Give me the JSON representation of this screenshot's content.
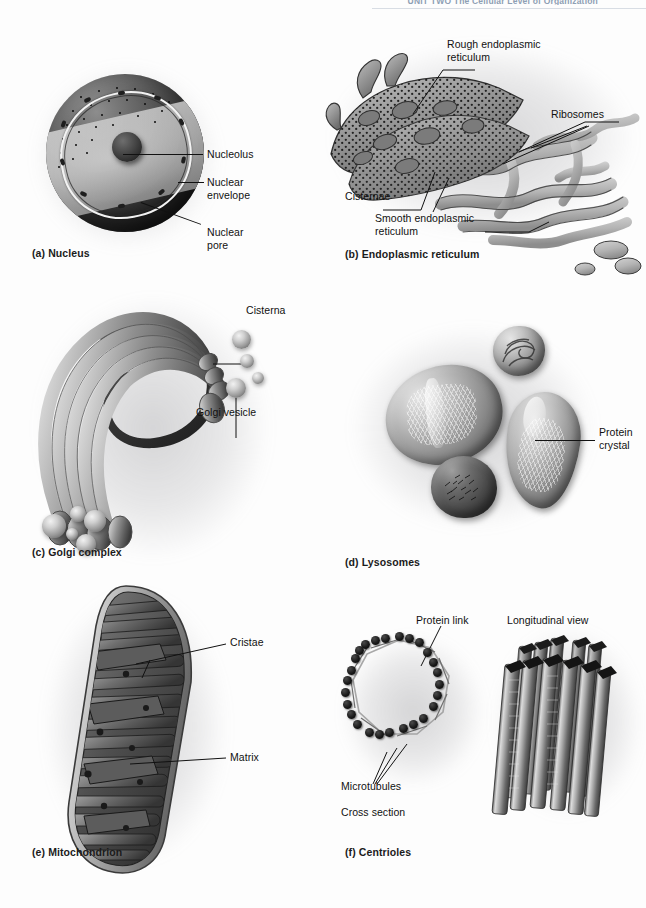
{
  "running_head": {
    "text": "UNIT TWO  The Cellular Level of Organization",
    "visible": true
  },
  "figure": {
    "panels": [
      {
        "id": "a",
        "caption": "(a) Nucleus",
        "labels": [
          {
            "name": "nucleolus",
            "text": "Nucleolus"
          },
          {
            "name": "nuclear-envelope",
            "text": "Nuclear\nenvelope"
          },
          {
            "name": "nuclear-pore",
            "text": "Nuclear\npore"
          }
        ]
      },
      {
        "id": "b",
        "caption": "(b) Endoplasmic reticulum",
        "labels": [
          {
            "name": "rough-er",
            "text": "Rough endoplasmic\nreticulum"
          },
          {
            "name": "ribosomes",
            "text": "Ribosomes"
          },
          {
            "name": "cisternae",
            "text": "Cisternae"
          },
          {
            "name": "smooth-er",
            "text": "Smooth endoplasmic\nreticulum"
          }
        ]
      },
      {
        "id": "c",
        "caption": "(c) Golgi complex",
        "labels": [
          {
            "name": "cisterna",
            "text": "Cisterna"
          },
          {
            "name": "golgi-vesicle",
            "text": "Golgi vesicle"
          }
        ]
      },
      {
        "id": "d",
        "caption": "(d) Lysosomes",
        "labels": [
          {
            "name": "protein-crystal",
            "text": "Protein\ncrystal"
          }
        ]
      },
      {
        "id": "e",
        "caption": "(e) Mitochondrion",
        "labels": [
          {
            "name": "cristae",
            "text": "Cristae"
          },
          {
            "name": "matrix",
            "text": "Matrix"
          }
        ]
      },
      {
        "id": "f",
        "caption": "(f) Centrioles",
        "labels": [
          {
            "name": "protein-link",
            "text": "Protein link"
          },
          {
            "name": "longitudinal-view",
            "text": "Longitudinal view"
          },
          {
            "name": "microtubules",
            "text": "Microtubules"
          },
          {
            "name": "cross-section",
            "text": "Cross section"
          }
        ]
      }
    ]
  },
  "colors": {
    "page_background": "#fdfdfd",
    "label_text": "#111111",
    "caption_text": "#1b1b1b",
    "running_head_text": "#8e9fb4",
    "leader_line": "#111111"
  }
}
